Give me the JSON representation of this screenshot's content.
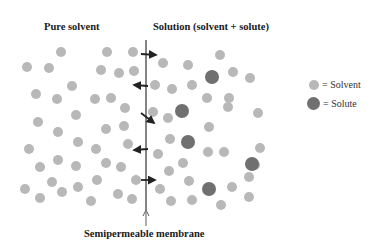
{
  "labels": {
    "pure_solvent": "Pure solvent",
    "solution": "Solution (solvent + solute)",
    "membrane": "Semipermeable membrane"
  },
  "legend": [
    {
      "name": "solvent",
      "label": "= Solvent",
      "color": "#b8b8b8"
    },
    {
      "name": "solute",
      "label": "= Solute",
      "color": "#707070"
    }
  ],
  "colors": {
    "solvent": "#b8b8b8",
    "solute": "#707070",
    "membrane": "#333333"
  },
  "membrane": {
    "x": 146,
    "y1": 40,
    "y2": 225
  },
  "arrows": [
    {
      "from": [
        141,
        54
      ],
      "to": [
        156,
        55
      ]
    },
    {
      "from": [
        148,
        86
      ],
      "to": [
        134,
        85
      ]
    },
    {
      "from": [
        141,
        113
      ],
      "to": [
        154,
        123
      ]
    },
    {
      "from": [
        148,
        149
      ],
      "to": [
        134,
        150
      ]
    },
    {
      "from": [
        141,
        180
      ],
      "to": [
        155,
        180
      ]
    }
  ],
  "solvent_particles": [
    [
      61,
      52
    ],
    [
      27,
      67
    ],
    [
      49,
      68
    ],
    [
      107,
      52
    ],
    [
      101,
      70
    ],
    [
      119,
      73
    ],
    [
      133,
      52
    ],
    [
      134,
      71
    ],
    [
      72,
      86
    ],
    [
      36,
      94
    ],
    [
      57,
      99
    ],
    [
      95,
      99
    ],
    [
      111,
      98
    ],
    [
      76,
      115
    ],
    [
      125,
      108
    ],
    [
      38,
      122
    ],
    [
      58,
      132
    ],
    [
      106,
      129
    ],
    [
      124,
      126
    ],
    [
      29,
      149
    ],
    [
      78,
      142
    ],
    [
      96,
      149
    ],
    [
      128,
      144
    ],
    [
      40,
      167
    ],
    [
      58,
      160
    ],
    [
      76,
      166
    ],
    [
      106,
      163
    ],
    [
      121,
      167
    ],
    [
      52,
      182
    ],
    [
      97,
      180
    ],
    [
      136,
      180
    ],
    [
      25,
      189
    ],
    [
      62,
      192
    ],
    [
      78,
      187
    ],
    [
      118,
      194
    ],
    [
      40,
      198
    ],
    [
      91,
      201
    ],
    [
      132,
      199
    ],
    [
      163,
      63
    ],
    [
      188,
      65
    ],
    [
      220,
      55
    ],
    [
      233,
      72
    ],
    [
      250,
      78
    ],
    [
      155,
      85
    ],
    [
      172,
      89
    ],
    [
      192,
      85
    ],
    [
      207,
      98
    ],
    [
      229,
      98
    ],
    [
      153,
      112
    ],
    [
      168,
      118
    ],
    [
      228,
      107
    ],
    [
      258,
      113
    ],
    [
      170,
      139
    ],
    [
      209,
      127
    ],
    [
      224,
      152
    ],
    [
      158,
      154
    ],
    [
      208,
      152
    ],
    [
      260,
      148
    ],
    [
      169,
      171
    ],
    [
      183,
      163
    ],
    [
      255,
      165
    ],
    [
      189,
      181
    ],
    [
      232,
      187
    ],
    [
      249,
      177
    ],
    [
      160,
      189
    ],
    [
      171,
      201
    ],
    [
      192,
      200
    ],
    [
      221,
      205
    ],
    [
      249,
      197
    ]
  ],
  "solute_particles": [
    [
      212,
      77
    ],
    [
      182,
      111
    ],
    [
      252,
      164
    ],
    [
      188,
      142
    ],
    [
      209,
      189
    ]
  ]
}
